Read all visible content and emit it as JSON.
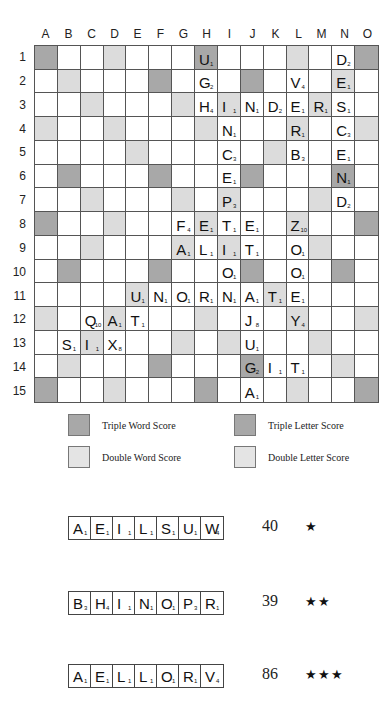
{
  "board": {
    "columns": [
      "A",
      "B",
      "C",
      "D",
      "E",
      "F",
      "G",
      "H",
      "I",
      "J",
      "K",
      "L",
      "M",
      "N",
      "O"
    ],
    "rows": [
      "1",
      "2",
      "3",
      "4",
      "5",
      "6",
      "7",
      "8",
      "9",
      "10",
      "11",
      "12",
      "13",
      "14",
      "15"
    ],
    "premium": {
      "TW": [
        "A1",
        "H1",
        "O1",
        "A8",
        "O8",
        "A15",
        "H15",
        "O15"
      ],
      "DW": [
        "B2",
        "C3",
        "D4",
        "E5",
        "N2",
        "M3",
        "L4",
        "K5",
        "B14",
        "C13",
        "D12",
        "E11",
        "N14",
        "M13",
        "L12",
        "K11",
        "H8"
      ],
      "TL": [
        "F2",
        "J2",
        "B6",
        "F6",
        "J6",
        "N6",
        "B10",
        "F10",
        "J10",
        "N10",
        "F14",
        "J14"
      ],
      "DL": [
        "D1",
        "L1",
        "G3",
        "I3",
        "A4",
        "H4",
        "O4",
        "C7",
        "G7",
        "I7",
        "M7",
        "D8",
        "L8",
        "C9",
        "G9",
        "I9",
        "M9",
        "A12",
        "H12",
        "O12",
        "G13",
        "I13",
        "D15",
        "L15"
      ]
    },
    "tiles": {
      "H1": [
        "U",
        "1"
      ],
      "N1": [
        "D",
        "2"
      ],
      "H2": [
        "G",
        "2"
      ],
      "L2": [
        "V",
        "4"
      ],
      "N2": [
        "E",
        "1"
      ],
      "H3": [
        "H",
        "4"
      ],
      "I3": [
        "I",
        "1"
      ],
      "J3": [
        "N",
        "1"
      ],
      "K3": [
        "D",
        "2"
      ],
      "L3": [
        "E",
        "1"
      ],
      "M3": [
        "R",
        "1"
      ],
      "N3": [
        "S",
        "1"
      ],
      "I4": [
        "N",
        "1"
      ],
      "L4": [
        "R",
        "1"
      ],
      "N4": [
        "C",
        "3"
      ],
      "I5": [
        "C",
        "3"
      ],
      "L5": [
        "B",
        "3"
      ],
      "N5": [
        "E",
        "1"
      ],
      "I6": [
        "E",
        "1"
      ],
      "N6": [
        "N",
        "1"
      ],
      "I7": [
        "P",
        "3"
      ],
      "N7": [
        "D",
        "2"
      ],
      "G8": [
        "F",
        "4"
      ],
      "H8": [
        "E",
        "1"
      ],
      "I8": [
        "T",
        "1"
      ],
      "J8": [
        "E",
        "1"
      ],
      "L8": [
        "Z",
        "10"
      ],
      "G9": [
        "A",
        "1"
      ],
      "H9": [
        "L",
        "1"
      ],
      "I9": [
        "I",
        "1"
      ],
      "J9": [
        "T",
        "1"
      ],
      "L9": [
        "O",
        "1"
      ],
      "I10": [
        "O",
        "1"
      ],
      "L10": [
        "O",
        "1"
      ],
      "E11": [
        "U",
        "1"
      ],
      "F11": [
        "N",
        "1"
      ],
      "G11": [
        "O",
        "1"
      ],
      "H11": [
        "R",
        "1"
      ],
      "I11": [
        "N",
        "1"
      ],
      "J11": [
        "A",
        "1"
      ],
      "K11": [
        "T",
        "1"
      ],
      "L11": [
        "E",
        "1"
      ],
      "C12": [
        "Q",
        "10"
      ],
      "D12": [
        "A",
        "1"
      ],
      "E12": [
        "T",
        "1"
      ],
      "J12": [
        "J",
        "8"
      ],
      "L12": [
        "Y",
        "4"
      ],
      "B13": [
        "S",
        "1"
      ],
      "C13": [
        "I",
        "1"
      ],
      "D13": [
        "X",
        "8"
      ],
      "J13": [
        "U",
        "1"
      ],
      "J14": [
        "G",
        "2"
      ],
      "K14": [
        "I",
        "1"
      ],
      "L14": [
        "T",
        "1"
      ],
      "J15": [
        "A",
        "1"
      ]
    }
  },
  "legend": [
    {
      "label": "Triple Word Score",
      "swatch": "dark"
    },
    {
      "label": "Triple Letter Score",
      "swatch": "dark"
    },
    {
      "label": "Double Word Score",
      "swatch": "light"
    },
    {
      "label": "Double Letter Score",
      "swatch": "light"
    }
  ],
  "racks": [
    {
      "tiles": [
        [
          "A",
          "1"
        ],
        [
          "E",
          "1"
        ],
        [
          "I",
          "1"
        ],
        [
          "L",
          "1"
        ],
        [
          "S",
          "1"
        ],
        [
          "U",
          "1"
        ],
        [
          "W",
          "4"
        ]
      ],
      "score": "40",
      "stars": "★"
    },
    {
      "tiles": [
        [
          "B",
          "3"
        ],
        [
          "H",
          "4"
        ],
        [
          "I",
          "1"
        ],
        [
          "N",
          "1"
        ],
        [
          "O",
          "1"
        ],
        [
          "P",
          "3"
        ],
        [
          "R",
          "1"
        ]
      ],
      "score": "39",
      "stars": "★★"
    },
    {
      "tiles": [
        [
          "A",
          "1"
        ],
        [
          "E",
          "1"
        ],
        [
          "L",
          "1"
        ],
        [
          "L",
          "1"
        ],
        [
          "O",
          "1"
        ],
        [
          "R",
          "1"
        ],
        [
          "V",
          "4"
        ]
      ],
      "score": "86",
      "stars": "★★★"
    }
  ],
  "colors": {
    "dark_premium": "#a8a8a8",
    "light_premium": "#dcdcdc",
    "grid": "#555555"
  }
}
